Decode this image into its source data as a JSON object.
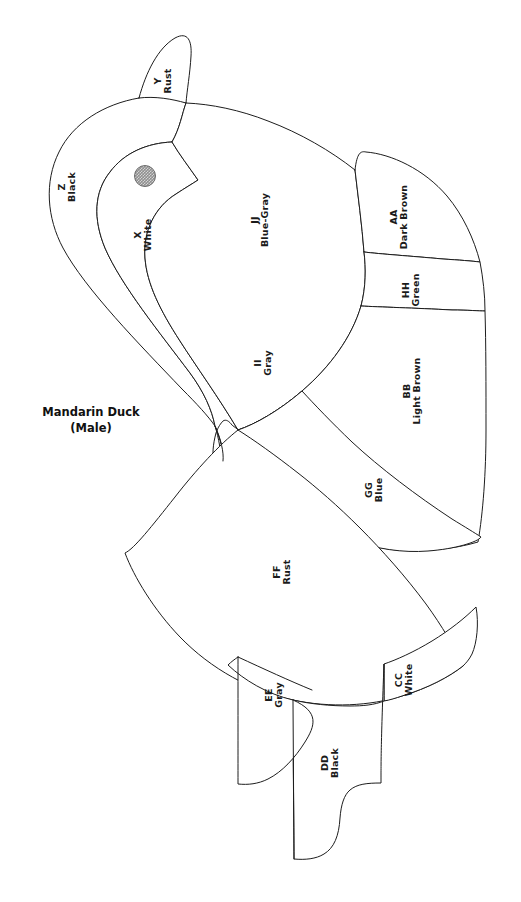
{
  "title": {
    "line1": "Mandarin Duck",
    "line2": "(Male)"
  },
  "diagram": {
    "style": "line-art-color-key-pattern",
    "background_color": "#ffffff",
    "stroke_color": "#1d1d1d",
    "eye": {
      "name": "eye-dot",
      "fill": "#8f8f8f",
      "pattern": "stippled-halftone",
      "center_x": 145,
      "center_y": 176,
      "radius": 11
    }
  },
  "regions": [
    {
      "code": "X",
      "color": "White",
      "label_x": 143,
      "label_y": 236
    },
    {
      "code": "Y",
      "color": "Rust",
      "label_x": 162,
      "label_y": 82
    },
    {
      "code": "Z",
      "color": "Black",
      "label_x": 67,
      "label_y": 188
    },
    {
      "code": "AA",
      "color": "Dark Brown",
      "label_x": 399,
      "label_y": 218
    },
    {
      "code": "BB",
      "color": "Light Brown",
      "label_x": 412,
      "label_y": 392
    },
    {
      "code": "CC",
      "color": "White",
      "label_x": 404,
      "label_y": 681
    },
    {
      "code": "DD",
      "color": "Black",
      "label_x": 330,
      "label_y": 764
    },
    {
      "code": "EE",
      "color": "Gray",
      "label_x": 274,
      "label_y": 696
    },
    {
      "code": "FF",
      "color": "Rust",
      "label_x": 281,
      "label_y": 573
    },
    {
      "code": "GG",
      "color": "Blue",
      "label_x": 374,
      "label_y": 491
    },
    {
      "code": "HH",
      "color": "Green",
      "label_x": 410,
      "label_y": 291
    },
    {
      "code": "II",
      "color": "Gray",
      "label_x": 263,
      "label_y": 364
    },
    {
      "code": "JJ",
      "color": "Blue-Gray",
      "label_x": 260,
      "label_y": 221
    }
  ],
  "legend_summary": {
    "region_count": 13,
    "color_names": [
      "White",
      "Rust",
      "Black",
      "Dark Brown",
      "Light Brown",
      "Gray",
      "Blue",
      "Green",
      "Blue-Gray"
    ]
  }
}
